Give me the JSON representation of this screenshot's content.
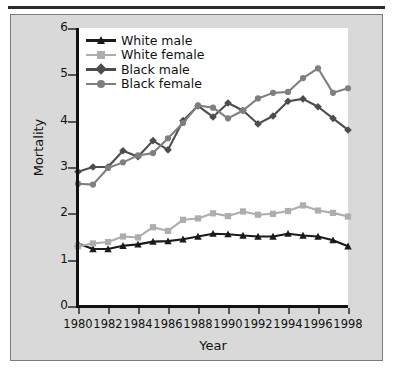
{
  "chart_data": {
    "type": "line",
    "title": "",
    "xlabel": "Year",
    "ylabel": "Mortality",
    "xlim": [
      1980,
      1998
    ],
    "ylim": [
      0,
      6
    ],
    "xticks": [
      1980,
      1982,
      1984,
      1986,
      1988,
      1990,
      1992,
      1994,
      1996,
      1998
    ],
    "yticks": [
      0,
      1,
      2,
      3,
      4,
      5,
      6
    ],
    "xtick_labels": [
      "1980",
      "1982",
      "1984",
      "1986",
      "1988",
      "1990",
      "1992",
      "1994",
      "1996",
      "1998"
    ],
    "ytick_labels": [
      "0",
      "1",
      "2",
      "3",
      "4",
      "5",
      "6"
    ],
    "grid": false,
    "legend_position": "upper-left",
    "x": [
      1980,
      1981,
      1982,
      1983,
      1984,
      1985,
      1986,
      1987,
      1988,
      1989,
      1990,
      1991,
      1992,
      1993,
      1994,
      1995,
      1996,
      1997,
      1998
    ],
    "series": [
      {
        "name": "White male",
        "color": "#1a1a1a",
        "marker": "triangle",
        "values": [
          1.35,
          1.23,
          1.23,
          1.3,
          1.33,
          1.39,
          1.4,
          1.44,
          1.5,
          1.56,
          1.55,
          1.52,
          1.5,
          1.5,
          1.56,
          1.52,
          1.5,
          1.42,
          1.29
        ]
      },
      {
        "name": "White female",
        "color": "#adadad",
        "marker": "square",
        "values": [
          1.29,
          1.35,
          1.38,
          1.5,
          1.48,
          1.7,
          1.62,
          1.86,
          1.89,
          2.0,
          1.94,
          2.04,
          1.97,
          1.99,
          2.05,
          2.17,
          2.06,
          2.01,
          1.93
        ]
      },
      {
        "name": "Black male",
        "color": "#4d4d4d",
        "marker": "diamond",
        "values": [
          2.9,
          3.0,
          3.0,
          3.35,
          3.22,
          3.57,
          3.37,
          4.0,
          4.32,
          4.08,
          4.38,
          4.22,
          3.93,
          4.1,
          4.42,
          4.47,
          4.3,
          4.05,
          3.8
        ]
      },
      {
        "name": "Black female",
        "color": "#7f7f7f",
        "marker": "circle",
        "values": [
          2.64,
          2.62,
          2.98,
          3.1,
          3.25,
          3.3,
          3.62,
          3.95,
          4.33,
          4.28,
          4.05,
          4.22,
          4.48,
          4.6,
          4.62,
          4.92,
          5.13,
          4.6,
          4.7
        ]
      }
    ]
  },
  "legend": {
    "items": [
      {
        "label": "White male"
      },
      {
        "label": "White female"
      },
      {
        "label": "Black male"
      },
      {
        "label": "Black female"
      }
    ]
  }
}
